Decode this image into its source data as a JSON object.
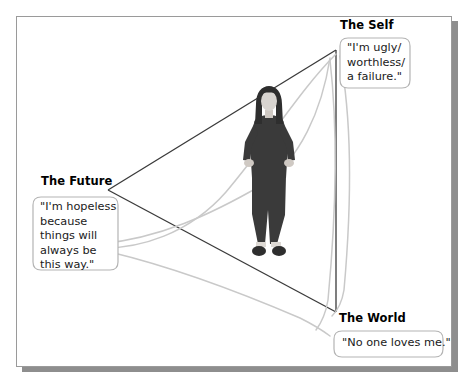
{
  "diagram": {
    "title_hidden": "",
    "type": "cognitive-triad",
    "nodes": [
      {
        "id": "self",
        "label": "The Self",
        "quote": "\"I'm ugly/\nworthless/\na failure.\"",
        "vertex": {
          "x": 336,
          "y": 50
        }
      },
      {
        "id": "future",
        "label": "The Future",
        "quote": "\"I'm hopeless\nbecause\nthings will\nalways be\nthis way.\"",
        "vertex": {
          "x": 108,
          "y": 190
        }
      },
      {
        "id": "world",
        "label": "The World",
        "quote": "\"No one loves me.\"",
        "vertex": {
          "x": 336,
          "y": 312
        }
      }
    ],
    "figure": {
      "name": "standing-person",
      "description": "person standing with hands on hips"
    },
    "colors": {
      "triangle_stroke": "#3a3a3a",
      "arrow_stroke": "#c9c9c9",
      "bubble_stroke": "#b4b4b4",
      "frame_border": "#9a9a9a",
      "frame_shadow": "#8e8e8e",
      "figure_dark": "#3a3a3a",
      "figure_skin": "#d8d4d0",
      "text": "#1a1a1a"
    }
  }
}
